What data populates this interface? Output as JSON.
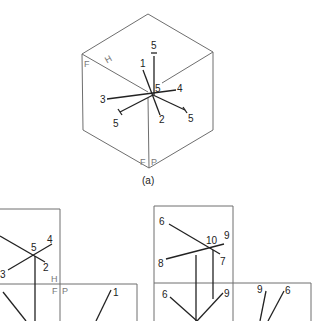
{
  "figure_a": {
    "caption": "(a)",
    "plane_labels": {
      "H": "H",
      "F": "F",
      "F2": "F",
      "P": "P"
    },
    "point_labels": {
      "top": "5",
      "p1": "1",
      "center": "5",
      "p4": "4",
      "p3": "3",
      "p2": "2",
      "left": "5",
      "right": "5"
    }
  },
  "figure_b": {
    "plane_labels": {
      "H": "H",
      "F": "F",
      "P": "P"
    },
    "point_labels": {
      "p5": "5",
      "p4": "4",
      "p3": "3",
      "p2": "2",
      "p1": "1"
    }
  },
  "figure_c": {
    "point_labels": {
      "p6": "6",
      "p10": "10",
      "p9": "9",
      "p8": "8",
      "p7": "7",
      "f6": "6",
      "f9": "9",
      "s9": "9",
      "s6": "6"
    }
  }
}
